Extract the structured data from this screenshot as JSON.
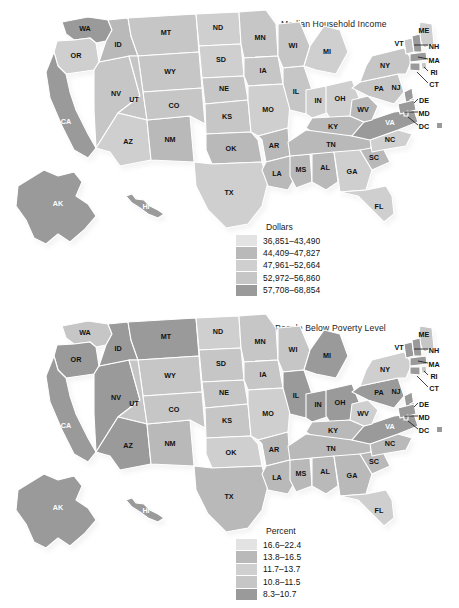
{
  "page": {
    "width": 459,
    "height": 608,
    "background": "#ffffff"
  },
  "maps": [
    {
      "id": "income",
      "title": "Median Household Income",
      "legend": {
        "title": "Dollars",
        "items": [
          {
            "label": "36,851–43,490",
            "color": "#e3e3e3"
          },
          {
            "label": "44,409–47,827",
            "color": "#b9b9b9"
          },
          {
            "label": "47,961–52,664",
            "color": "#cfcfcf"
          },
          {
            "label": "52,972–56,860",
            "color": "#c6c6c6"
          },
          {
            "label": "57,708–68,854",
            "color": "#9a9a9a"
          }
        ]
      },
      "callouts": [
        "NH",
        "MA",
        "RI",
        "CT",
        "DE",
        "MD",
        "DC"
      ],
      "states": [
        {
          "code": "WA",
          "shade": 4
        },
        {
          "code": "OR",
          "shade": 2
        },
        {
          "code": "CA",
          "shade": 4
        },
        {
          "code": "NV",
          "shade": 3
        },
        {
          "code": "ID",
          "shade": 1
        },
        {
          "code": "MT",
          "shade": 3
        },
        {
          "code": "WY",
          "shade": 3
        },
        {
          "code": "UT",
          "shade": 3
        },
        {
          "code": "AZ",
          "shade": 2
        },
        {
          "code": "NM",
          "shade": 1
        },
        {
          "code": "CO",
          "shade": 3
        },
        {
          "code": "ND",
          "shade": 2
        },
        {
          "code": "SD",
          "shade": 2
        },
        {
          "code": "NE",
          "shade": 3
        },
        {
          "code": "KS",
          "shade": 3
        },
        {
          "code": "OK",
          "shade": 1
        },
        {
          "code": "TX",
          "shade": 2
        },
        {
          "code": "MN",
          "shade": 3
        },
        {
          "code": "IA",
          "shade": 3
        },
        {
          "code": "MO",
          "shade": 2
        },
        {
          "code": "AR",
          "shade": 1
        },
        {
          "code": "LA",
          "shade": 1
        },
        {
          "code": "WI",
          "shade": 3
        },
        {
          "code": "IL",
          "shade": 3
        },
        {
          "code": "MS",
          "shade": 1
        },
        {
          "code": "MI",
          "shade": 2
        },
        {
          "code": "IN",
          "shade": 2
        },
        {
          "code": "OH",
          "shade": 2
        },
        {
          "code": "KY",
          "shade": 1
        },
        {
          "code": "TN",
          "shade": 1
        },
        {
          "code": "AL",
          "shade": 1
        },
        {
          "code": "GA",
          "shade": 2
        },
        {
          "code": "FL",
          "shade": 2
        },
        {
          "code": "SC",
          "shade": 1
        },
        {
          "code": "NC",
          "shade": 2
        },
        {
          "code": "VA",
          "shade": 4
        },
        {
          "code": "WV",
          "shade": 1
        },
        {
          "code": "PA",
          "shade": 3
        },
        {
          "code": "NY",
          "shade": 3
        },
        {
          "code": "VT",
          "shade": 3
        },
        {
          "code": "ME",
          "shade": 2
        },
        {
          "code": "NJ",
          "shade": 4
        },
        {
          "code": "NH",
          "shade": 4
        },
        {
          "code": "MA",
          "shade": 4
        },
        {
          "code": "RI",
          "shade": 3
        },
        {
          "code": "CT",
          "shade": 4
        },
        {
          "code": "DE",
          "shade": 4
        },
        {
          "code": "MD",
          "shade": 4
        },
        {
          "code": "DC",
          "shade": 4
        },
        {
          "code": "AK",
          "shade": 4
        },
        {
          "code": "HI",
          "shade": 4
        }
      ]
    },
    {
      "id": "poverty",
      "title": "People Below Poverty Level",
      "legend": {
        "title": "Percent",
        "items": [
          {
            "label": "16.6–22.4",
            "color": "#e3e3e3"
          },
          {
            "label": "13.8–16.5",
            "color": "#b9b9b9"
          },
          {
            "label": "11.7–13.7",
            "color": "#cfcfcf"
          },
          {
            "label": "10.8–11.5",
            "color": "#c6c6c6"
          },
          {
            "label": "8.3–10.7",
            "color": "#9a9a9a"
          }
        ]
      },
      "callouts": [
        "NH",
        "MA",
        "RI",
        "CT",
        "DE",
        "MD",
        "DC"
      ],
      "states": [
        {
          "code": "WA",
          "shade": 3
        },
        {
          "code": "OR",
          "shade": 4
        },
        {
          "code": "CA",
          "shade": 4
        },
        {
          "code": "NV",
          "shade": 4
        },
        {
          "code": "ID",
          "shade": 4
        },
        {
          "code": "MT",
          "shade": 4
        },
        {
          "code": "WY",
          "shade": 3
        },
        {
          "code": "UT",
          "shade": 3
        },
        {
          "code": "AZ",
          "shade": 4
        },
        {
          "code": "NM",
          "shade": 1
        },
        {
          "code": "CO",
          "shade": 3
        },
        {
          "code": "ND",
          "shade": 2
        },
        {
          "code": "SD",
          "shade": 3
        },
        {
          "code": "NE",
          "shade": 3
        },
        {
          "code": "KS",
          "shade": 3
        },
        {
          "code": "OK",
          "shade": 2
        },
        {
          "code": "TX",
          "shade": 1
        },
        {
          "code": "MN",
          "shade": 3
        },
        {
          "code": "IA",
          "shade": 3
        },
        {
          "code": "MO",
          "shade": 2
        },
        {
          "code": "AR",
          "shade": 1
        },
        {
          "code": "LA",
          "shade": 1
        },
        {
          "code": "WI",
          "shade": 3
        },
        {
          "code": "IL",
          "shade": 4
        },
        {
          "code": "MS",
          "shade": 1
        },
        {
          "code": "MI",
          "shade": 4
        },
        {
          "code": "IN",
          "shade": 4
        },
        {
          "code": "OH",
          "shade": 4
        },
        {
          "code": "KY",
          "shade": 1
        },
        {
          "code": "TN",
          "shade": 1
        },
        {
          "code": "AL",
          "shade": 1
        },
        {
          "code": "GA",
          "shade": 1
        },
        {
          "code": "FL",
          "shade": 2
        },
        {
          "code": "SC",
          "shade": 1
        },
        {
          "code": "NC",
          "shade": 1
        },
        {
          "code": "VA",
          "shade": 4
        },
        {
          "code": "WV",
          "shade": 2
        },
        {
          "code": "PA",
          "shade": 4
        },
        {
          "code": "NY",
          "shade": 2
        },
        {
          "code": "VT",
          "shade": 4
        },
        {
          "code": "ME",
          "shade": 3
        },
        {
          "code": "NJ",
          "shade": 4
        },
        {
          "code": "NH",
          "shade": 4
        },
        {
          "code": "MA",
          "shade": 4
        },
        {
          "code": "RI",
          "shade": 3
        },
        {
          "code": "CT",
          "shade": 4
        },
        {
          "code": "DE",
          "shade": 4
        },
        {
          "code": "MD",
          "shade": 4
        },
        {
          "code": "DC",
          "shade": 4
        },
        {
          "code": "AK",
          "shade": 4
        },
        {
          "code": "HI",
          "shade": 4
        }
      ]
    }
  ]
}
